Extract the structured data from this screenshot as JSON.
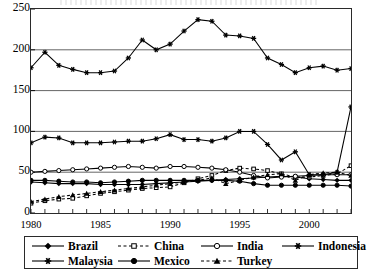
{
  "chart_data": {
    "type": "line",
    "title": "",
    "xlabel": "",
    "ylabel": "",
    "xlim": [
      1980,
      2003
    ],
    "ylim": [
      0,
      250
    ],
    "yticks": [
      0,
      50,
      100,
      150,
      200,
      250
    ],
    "xticks": [
      1980,
      1985,
      1990,
      1995,
      2000
    ],
    "xtick_labels": [
      "1980",
      "1985",
      "1990",
      "1995",
      "2000"
    ],
    "grid": true,
    "legend_position": "bottom",
    "x": [
      1980,
      1981,
      1982,
      1983,
      1984,
      1985,
      1986,
      1987,
      1988,
      1989,
      1990,
      1991,
      1992,
      1993,
      1994,
      1995,
      1996,
      1997,
      1998,
      1999,
      2000,
      2001,
      2002,
      2003
    ],
    "series": [
      {
        "name": "Brazil",
        "marker": "filled-diamond",
        "dash": "solid",
        "values": [
          38,
          37,
          36,
          36,
          36,
          35,
          35,
          35,
          35,
          36,
          37,
          38,
          39,
          40,
          41,
          42,
          43,
          44,
          45,
          44,
          42,
          41,
          40,
          40
        ]
      },
      {
        "name": "China",
        "marker": "open-square",
        "dash": "dashed",
        "values": [
          12,
          15,
          17,
          18,
          21,
          24,
          26,
          28,
          30,
          31,
          32,
          37,
          42,
          46,
          52,
          55,
          54,
          52,
          48,
          44,
          44,
          46,
          48,
          58
        ]
      },
      {
        "name": "India",
        "marker": "open-circle",
        "dash": "solid",
        "values": [
          50,
          51,
          52,
          53,
          54,
          55,
          56,
          57,
          56,
          55,
          57,
          57,
          56,
          55,
          53,
          50,
          46,
          43,
          44,
          45,
          46,
          47,
          47,
          47
        ]
      },
      {
        "name": "Indonesia",
        "marker": "star",
        "dash": "solid",
        "values": [
          178,
          197,
          181,
          176,
          172,
          172,
          174,
          190,
          212,
          200,
          207,
          223,
          237,
          235,
          218,
          217,
          214,
          190,
          182,
          172,
          178,
          180,
          175,
          177
        ]
      },
      {
        "name": "Malaysia",
        "marker": "star",
        "dash": "solid",
        "values": [
          86,
          93,
          92,
          86,
          86,
          86,
          87,
          88,
          88,
          91,
          96,
          90,
          90,
          88,
          92,
          100,
          100,
          84,
          65,
          75,
          47,
          47,
          50,
          130
        ]
      },
      {
        "name": "Mexico",
        "marker": "filled-circle",
        "dash": "solid",
        "values": [
          40,
          40,
          39,
          38,
          38,
          37,
          38,
          39,
          40,
          40,
          40,
          40,
          40,
          40,
          40,
          39,
          36,
          34,
          34,
          34,
          34,
          34,
          34,
          33
        ]
      },
      {
        "name": "Turkey",
        "marker": "filled-triangle",
        "dash": "dashed",
        "values": [
          14,
          17,
          20,
          22,
          24,
          26,
          28,
          30,
          32,
          34,
          36,
          38,
          40,
          43,
          36,
          40,
          44,
          47,
          48,
          40,
          47,
          49,
          50,
          46
        ]
      }
    ]
  },
  "legend": {
    "row1": [
      {
        "label": "Brazil",
        "name": "legend-item-brazil"
      },
      {
        "label": "China",
        "name": "legend-item-china"
      },
      {
        "label": "India",
        "name": "legend-item-india"
      },
      {
        "label": "Indonesia",
        "name": "legend-item-indonesia"
      }
    ],
    "row2": [
      {
        "label": "Malaysia",
        "name": "legend-item-malaysia"
      },
      {
        "label": "Mexico",
        "name": "legend-item-mexico"
      },
      {
        "label": "Turkey",
        "name": "legend-item-turkey"
      }
    ]
  },
  "axis": {
    "y_labels": [
      "250",
      "200",
      "150",
      "100",
      "50",
      "0"
    ]
  }
}
